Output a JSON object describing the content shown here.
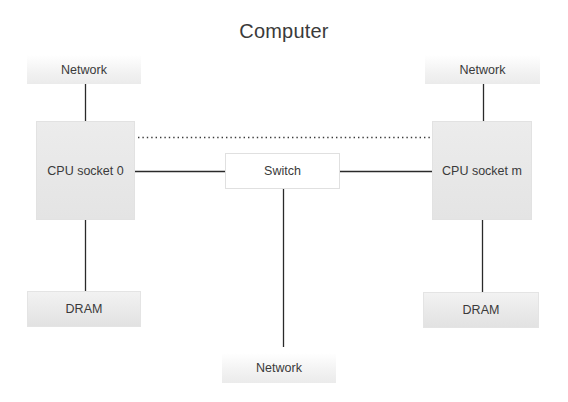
{
  "diagram": {
    "title": "Computer",
    "nodes": {
      "network_top_left": {
        "label": "Network"
      },
      "network_top_right": {
        "label": "Network"
      },
      "network_bottom": {
        "label": "Network"
      },
      "cpu_socket_0": {
        "label": "CPU socket 0"
      },
      "cpu_socket_m": {
        "label": "CPU socket m"
      },
      "switch": {
        "label": "Switch"
      },
      "dram_left": {
        "label": "DRAM"
      },
      "dram_right": {
        "label": "DRAM"
      }
    },
    "edges": [
      {
        "from": "network_top_left",
        "to": "cpu_socket_0",
        "style": "solid"
      },
      {
        "from": "network_top_right",
        "to": "cpu_socket_m",
        "style": "solid"
      },
      {
        "from": "cpu_socket_0",
        "to": "dram_left",
        "style": "solid"
      },
      {
        "from": "cpu_socket_m",
        "to": "dram_right",
        "style": "solid"
      },
      {
        "from": "cpu_socket_0",
        "to": "switch",
        "style": "solid"
      },
      {
        "from": "switch",
        "to": "cpu_socket_m",
        "style": "solid"
      },
      {
        "from": "switch",
        "to": "network_bottom",
        "style": "solid"
      },
      {
        "from": "cpu_socket_0",
        "to": "cpu_socket_m",
        "style": "dotted"
      }
    ],
    "colors": {
      "line": "#2a2a2a",
      "box_fill": "#e6e6e6",
      "text": "#3a3a3a"
    }
  }
}
